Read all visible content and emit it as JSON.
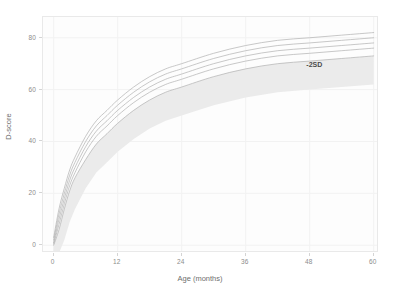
{
  "chart_data": {
    "type": "line",
    "title": "",
    "subtitle": "",
    "xlabel": "Age (months)",
    "ylabel": "D-score",
    "xlim": [
      -2,
      61
    ],
    "ylim": [
      -3,
      88
    ],
    "xticks": [
      0,
      12,
      24,
      36,
      48,
      60
    ],
    "yticks": [
      0,
      20,
      40,
      60,
      80
    ],
    "xtick_labels": [
      "0",
      "12",
      "24",
      "36",
      "48",
      "60"
    ],
    "ytick_labels": [
      "0",
      "20",
      "40",
      "60",
      "80"
    ],
    "grid": true,
    "legend": "none",
    "panel_background": "#fdfdfd",
    "grid_color": "#f2f2f2",
    "line_color": "#b0b0b0",
    "band_color": "#ebebeb",
    "x": [
      0,
      1,
      2,
      3,
      4,
      6,
      8,
      10,
      12,
      15,
      18,
      21,
      24,
      30,
      36,
      42,
      48,
      54,
      60
    ],
    "series": [
      {
        "name": "+2SD",
        "values": [
          3,
          14,
          22,
          29,
          34,
          42,
          48,
          52,
          56,
          61,
          65,
          68,
          70,
          74,
          77,
          79,
          80,
          81,
          82
        ]
      },
      {
        "name": "+1SD",
        "values": [
          2,
          12,
          20,
          27,
          32,
          40,
          46,
          50,
          54,
          59,
          63,
          66,
          68,
          72,
          75,
          77,
          78,
          79,
          80
        ]
      },
      {
        "name": "median",
        "values": [
          1,
          10,
          18,
          25,
          30,
          38,
          44,
          48,
          52,
          57,
          61,
          64,
          66,
          70,
          73,
          75,
          76,
          77,
          78
        ]
      },
      {
        "name": "-1SD",
        "values": [
          0.5,
          8,
          16,
          23,
          28,
          36,
          42,
          46,
          50,
          55,
          59,
          62,
          64,
          68,
          71,
          73,
          74,
          75,
          76
        ]
      },
      {
        "name": "-2SD",
        "values": [
          0,
          6,
          14,
          21,
          26,
          33,
          39,
          43,
          47,
          52,
          56,
          59,
          61,
          65,
          68,
          70,
          71,
          72,
          73
        ]
      }
    ],
    "bands": [
      {
        "name": "below-minus-2sd-band",
        "upper_series": "-2SD",
        "lower_values": [
          -3,
          -3,
          2,
          9,
          14,
          22,
          28,
          32,
          36,
          41,
          45,
          48,
          50,
          54,
          57,
          59,
          60,
          61,
          62
        ]
      }
    ],
    "annotations": [
      {
        "text": "-2SD",
        "x": 50,
        "y": 69
      }
    ]
  }
}
